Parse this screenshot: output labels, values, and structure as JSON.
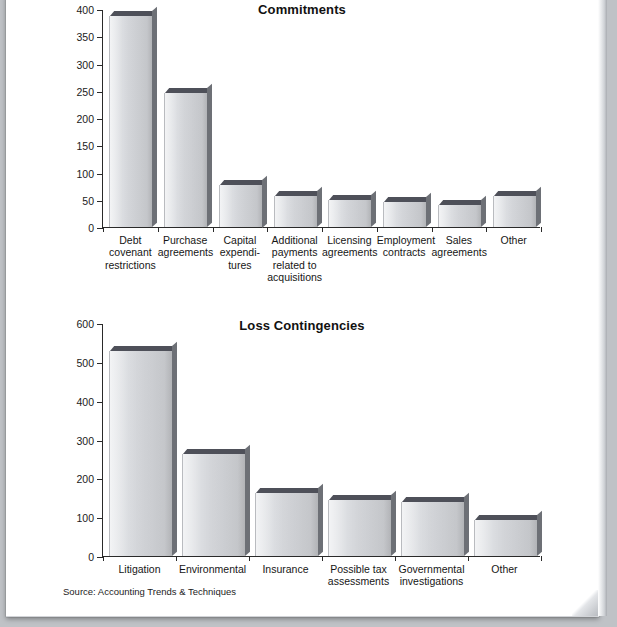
{
  "page": {
    "source_note": "Source: Accounting Trends & Techniques"
  },
  "chart_data": [
    {
      "type": "bar",
      "title": "Commitments",
      "xlabel": "",
      "ylabel": "",
      "ylim": [
        0,
        400
      ],
      "yticks": [
        0,
        50,
        100,
        150,
        200,
        250,
        300,
        350,
        400
      ],
      "grid": false,
      "legend": "none",
      "bar_color": "#d6d8dc",
      "bar_top_color": "#4e5059",
      "categories": [
        "Debt covenant restrictions",
        "Purchase agreements",
        "Capital expenditures",
        "Additional payments related to acquisitions",
        "Licensing agreements",
        "Employment contracts",
        "Sales agreements",
        "Other"
      ],
      "category_lines": [
        [
          "Debt",
          "covenant",
          "restrictions"
        ],
        [
          "Purchase",
          "agreements"
        ],
        [
          "Capital",
          "expendi-",
          "tures"
        ],
        [
          "Additional",
          "payments",
          "related to",
          "acquisitions"
        ],
        [
          "Licensing",
          "agreements"
        ],
        [
          "Employment",
          "contracts"
        ],
        [
          "Sales",
          "agreements"
        ],
        [
          "Other"
        ]
      ],
      "values": [
        388,
        245,
        78,
        57,
        49,
        45,
        40,
        56
      ]
    },
    {
      "type": "bar",
      "title": "Loss Contingencies",
      "xlabel": "",
      "ylabel": "",
      "ylim": [
        0,
        600
      ],
      "yticks": [
        0,
        100,
        200,
        300,
        400,
        500,
        600
      ],
      "grid": false,
      "legend": "none",
      "bar_color": "#d6d8dc",
      "bar_top_color": "#4e5059",
      "categories": [
        "Litigation",
        "Environmental",
        "Insurance",
        "Possible tax assessments",
        "Governmental investigations",
        "Other"
      ],
      "category_lines": [
        [
          "Litigation"
        ],
        [
          "Environmental"
        ],
        [
          "Insurance"
        ],
        [
          "Possible tax",
          "assessments"
        ],
        [
          "Governmental",
          "investigations"
        ],
        [
          "Other"
        ]
      ],
      "values": [
        528,
        263,
        163,
        145,
        140,
        93
      ]
    }
  ]
}
